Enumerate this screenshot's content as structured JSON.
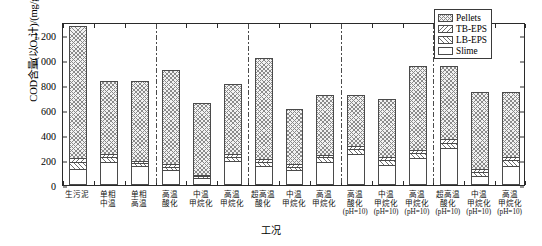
{
  "chart_data": {
    "type": "bar",
    "subtype": "stacked-bar",
    "title": "",
    "xlabel": "工况",
    "ylabel": "COD含量(以O₂计)/(mg/g)",
    "ylim": [
      0,
      1300
    ],
    "yticks": [
      0,
      200,
      400,
      600,
      800,
      1000,
      1200
    ],
    "ytick_labels": [
      "0",
      "200",
      "400",
      "600",
      "800",
      "1 000",
      "1 200"
    ],
    "grid": false,
    "legend_position": "top-right",
    "legend": [
      "Pellets",
      "TB-EPS",
      "LB-EPS",
      "Slime"
    ],
    "series_order_bottom_to_top": [
      "Slime",
      "LB-EPS",
      "TB-EPS",
      "Pellets"
    ],
    "categories": [
      "生污泥",
      "单相中温",
      "单相高温",
      "高温酸化",
      "中温甲烷化",
      "高温甲烷化",
      "超高温酸化",
      "中温甲烷化",
      "高温甲烷化",
      "高温酸化(pH=10)",
      "中温甲烷化(pH=10)",
      "高温甲烷化(pH=10)",
      "超高温酸化(pH=10)",
      "中温甲烷化(pH=10)",
      "高温甲烷化(pH=10)"
    ],
    "category_lines": [
      [
        "生污泥"
      ],
      [
        "单相",
        "中温"
      ],
      [
        "单相",
        "高温"
      ],
      [
        "高温",
        "酸化"
      ],
      [
        "中温",
        "甲烷化"
      ],
      [
        "高温",
        "甲烷化"
      ],
      [
        "超高温",
        "酸化"
      ],
      [
        "中温",
        "甲烷化"
      ],
      [
        "高温",
        "甲烷化"
      ],
      [
        "高温",
        "酸化",
        "(pH=10)"
      ],
      [
        "中温",
        "甲烷化",
        "(pH=10)"
      ],
      [
        "高温",
        "甲烷化",
        "(pH=10)"
      ],
      [
        "超高温",
        "酸化",
        "(pH=10)"
      ],
      [
        "中温",
        "甲烷化",
        "(pH=10)"
      ],
      [
        "高温",
        "甲烷化",
        "(pH=10)"
      ]
    ],
    "group_dividers_after_category_index": [
      2,
      5,
      8,
      11
    ],
    "series": [
      {
        "name": "Slime",
        "pattern": "blank",
        "values": [
          130,
          185,
          152,
          122,
          52,
          195,
          155,
          120,
          182,
          245,
          160,
          212,
          292,
          72,
          150
        ]
      },
      {
        "name": "LB-EPS",
        "pattern": "diagonal-up",
        "values": [
          55,
          40,
          22,
          25,
          18,
          32,
          32,
          25,
          38,
          42,
          42,
          45,
          40,
          30,
          48
        ]
      },
      {
        "name": "TB-EPS",
        "pattern": "diagonal-down",
        "values": [
          30,
          20,
          20,
          22,
          12,
          18,
          22,
          22,
          20,
          25,
          22,
          25,
          32,
          22,
          25
        ]
      },
      {
        "name": "Pellets",
        "pattern": "cross-hatch",
        "values": [
          1050,
          585,
          632,
          751,
          572,
          560,
          806,
          442,
          478,
          408,
          466,
          665,
          586,
          618,
          516
        ]
      }
    ],
    "totals": [
      1265,
      830,
      826,
      920,
      654,
      805,
      1015,
      609,
      718,
      720,
      690,
      947,
      950,
      742,
      739
    ]
  },
  "colors": {
    "axis": "#2a2a2a",
    "bar_outline": "#4a4a4a",
    "hatch": "#6e6e6e",
    "pellets_fill": "#f2f2f2",
    "background": "#ffffff"
  }
}
